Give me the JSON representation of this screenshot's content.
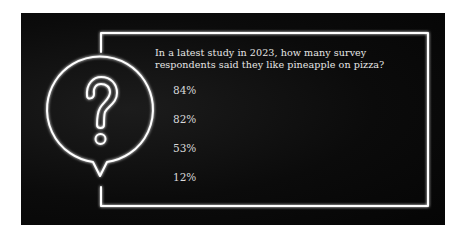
{
  "question": {
    "line1": "In a latest study in 2023, how many survey",
    "line2": "respondents said they like pineapple on pizza?"
  },
  "options": [
    {
      "label": "84%"
    },
    {
      "label": "82%"
    },
    {
      "label": "53%"
    },
    {
      "label": "12%"
    }
  ],
  "icon": "question-speech-bubble-icon",
  "colors": {
    "background": "#0b0b0b",
    "neon": "#ffffff",
    "text": "#e6e6e6"
  }
}
